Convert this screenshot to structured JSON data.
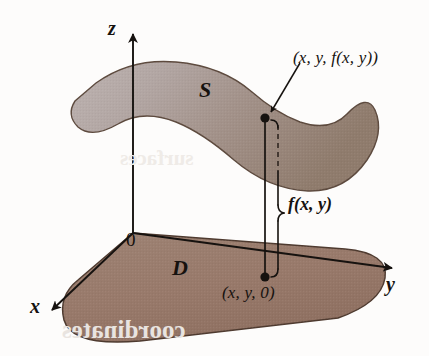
{
  "figure": {
    "kind": "3d-surface-over-domain-diagram",
    "background_color": "#fdfcfb"
  },
  "axes": {
    "z": {
      "label": "z",
      "direction": "up"
    },
    "x": {
      "label": "x",
      "direction": "down-left"
    },
    "y": {
      "label": "y",
      "direction": "right"
    },
    "origin": {
      "label": "0"
    },
    "color": "#16120f"
  },
  "regions": {
    "surface": {
      "label": "S",
      "fill_light": "#b4a9a7",
      "fill_dark": "#94806f",
      "stroke": "#5d4a3e"
    },
    "domain": {
      "label": "D",
      "fill": "#9a7c6d",
      "stroke": "#4e3a2f"
    }
  },
  "points": {
    "surface_point": {
      "label": "(x, y, f(x, y))",
      "marker": "filled-dot",
      "has_leader_arrow": true
    },
    "domain_point": {
      "label": "(x, y, 0)",
      "marker": "filled-dot"
    }
  },
  "measure": {
    "label": "f(x, y)",
    "brace_style": "vertical-curly-brace",
    "connector_style": "solid-vertical-line",
    "hidden_segment_style": "dashed"
  },
  "ghost_text": {
    "bottom": "coordinates",
    "middle": "surfaces"
  }
}
